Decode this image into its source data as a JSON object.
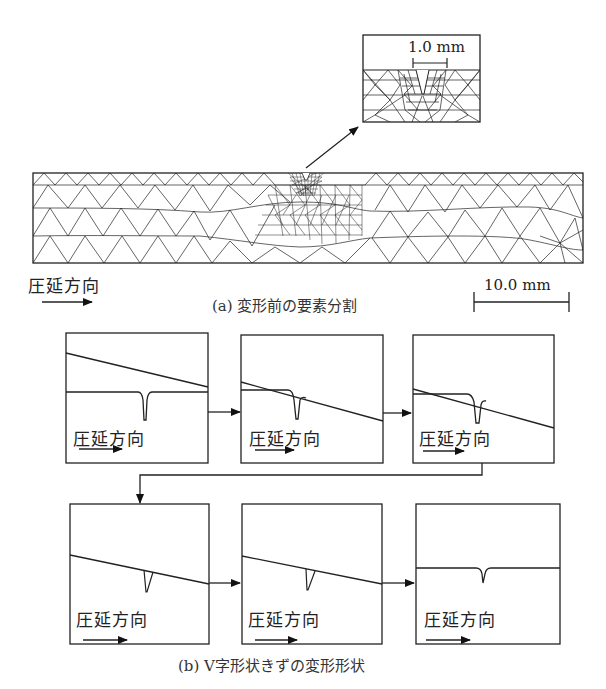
{
  "figure_a": {
    "inset_scale_label": "1.0 mm",
    "rolling_direction_label": "圧延方向",
    "caption": "(a) 変形前の要素分割",
    "scale_bar_label": "10.0 mm"
  },
  "figure_b": {
    "caption": "(b) V字形状きずの変形形状",
    "panels": [
      {
        "label": "圧延方向"
      },
      {
        "label": "圧延方向"
      },
      {
        "label": "圧延方向"
      },
      {
        "label": "圧延方向"
      },
      {
        "label": "圧延方向"
      },
      {
        "label": "圧延方向"
      }
    ]
  }
}
